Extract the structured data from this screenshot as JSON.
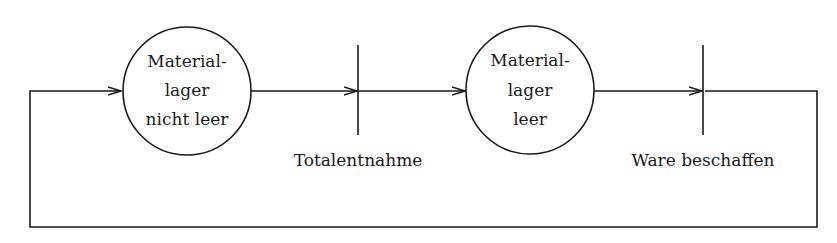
{
  "diagram": {
    "type": "petri-net",
    "places": [
      {
        "id": "p1",
        "lines": [
          "Material-",
          "lager",
          "nicht leer"
        ]
      },
      {
        "id": "p2",
        "lines": [
          "Material-",
          "lager",
          "leer"
        ]
      }
    ],
    "transitions": [
      {
        "id": "t1",
        "label": "Totalentnahme"
      },
      {
        "id": "t2",
        "label": "Ware beschaffen"
      }
    ],
    "arcs": [
      {
        "from": "p1",
        "to": "t1"
      },
      {
        "from": "t1",
        "to": "p2"
      },
      {
        "from": "p2",
        "to": "t2"
      },
      {
        "from": "t2",
        "to": "p1"
      }
    ],
    "colors": {
      "stroke": "#1a1a1a",
      "background": "#ffffff"
    }
  }
}
